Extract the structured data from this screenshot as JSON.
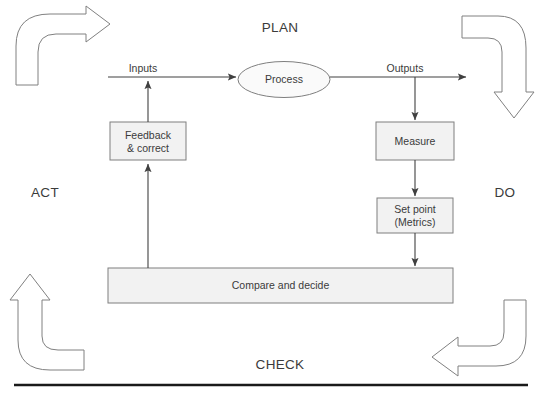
{
  "diagram": {
    "title_text": "PDCA control loop diagram",
    "cycle_labels": {
      "plan": "PLAN",
      "do": "DO",
      "check": "CHECK",
      "act": "ACT"
    },
    "flow_labels": {
      "inputs": "Inputs",
      "outputs": "Outputs"
    },
    "nodes": {
      "process": "Process",
      "feedback": "Feedback\n& correct",
      "feedback_line1": "Feedback",
      "feedback_line2": "& correct",
      "measure": "Measure",
      "setpoint_line1": "Set point",
      "setpoint_line2": "(Metrics)",
      "compare": "Compare and decide"
    },
    "colors": {
      "node_fill": "#f2f2f2",
      "node_stroke": "#7f7f7f",
      "line_stroke": "#404040",
      "arrow_stroke": "#7f7f7f",
      "text": "#3b3b3b",
      "rule": "#1a1a1a",
      "background": "#ffffff"
    }
  }
}
